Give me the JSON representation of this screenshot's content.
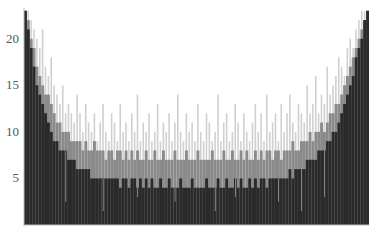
{
  "chart_data": {
    "type": "bar",
    "title": "",
    "xlabel": "",
    "ylabel": "",
    "ylim": [
      0,
      23.3
    ],
    "yticks": [
      5,
      10,
      15,
      20
    ],
    "grid": false,
    "legend": null,
    "n_bins": 120,
    "series": [
      {
        "name": "light",
        "color": "#c8c8c8",
        "values": [
          23,
          23,
          22,
          21,
          20,
          19,
          21,
          17,
          16,
          18,
          15,
          14,
          13,
          15,
          12,
          13,
          12,
          11,
          14,
          12,
          10,
          13,
          11,
          10,
          12,
          9,
          11,
          13,
          10,
          9,
          12,
          11,
          9,
          13,
          10,
          11,
          9,
          12,
          10,
          14,
          9,
          11,
          10,
          12,
          9,
          10,
          13,
          9,
          11,
          10,
          12,
          9,
          11,
          14,
          10,
          9,
          12,
          10,
          11,
          9,
          13,
          10,
          9,
          12,
          11,
          9,
          10,
          14,
          9,
          11,
          12,
          9,
          10,
          13,
          11,
          9,
          12,
          10,
          9,
          11,
          13,
          10,
          12,
          9,
          14,
          10,
          11,
          12,
          9,
          13,
          10,
          12,
          14,
          11,
          10,
          13,
          12,
          11,
          15,
          12,
          13,
          16,
          12,
          14,
          13,
          17,
          14,
          15,
          16,
          18,
          17,
          16,
          19,
          20,
          19,
          21,
          22,
          23,
          23,
          23
        ]
      },
      {
        "name": "mid",
        "color": "#8a8a8a",
        "values": [
          23,
          22,
          20,
          19,
          17,
          16,
          15,
          14,
          14,
          13,
          12,
          11,
          11,
          10,
          10,
          10,
          9,
          9,
          9,
          9,
          8,
          9,
          8,
          8,
          9,
          8,
          8,
          8,
          7,
          8,
          8,
          7,
          8,
          8,
          7,
          8,
          7,
          8,
          7,
          8,
          7,
          7,
          8,
          7,
          7,
          8,
          7,
          7,
          8,
          7,
          7,
          7,
          8,
          7,
          7,
          7,
          8,
          7,
          7,
          7,
          8,
          7,
          7,
          7,
          7,
          8,
          7,
          7,
          7,
          8,
          7,
          7,
          8,
          7,
          7,
          8,
          7,
          8,
          7,
          7,
          8,
          7,
          8,
          7,
          8,
          8,
          7,
          8,
          8,
          7,
          8,
          8,
          8,
          9,
          8,
          8,
          9,
          9,
          9,
          10,
          9,
          10,
          10,
          11,
          10,
          11,
          12,
          12,
          13,
          13,
          14,
          15,
          16,
          17,
          18,
          19,
          20,
          21,
          22,
          23
        ]
      },
      {
        "name": "dark",
        "color": "#2a2a2a",
        "values": [
          23,
          21,
          19,
          17,
          15,
          14,
          13,
          12,
          11,
          10,
          9,
          9,
          8,
          8,
          8,
          7,
          7,
          7,
          6,
          6,
          6,
          6,
          6,
          5,
          5,
          5,
          5,
          5,
          5,
          5,
          5,
          5,
          5,
          4,
          5,
          5,
          4,
          5,
          5,
          4,
          5,
          4,
          5,
          4,
          5,
          4,
          4,
          5,
          4,
          4,
          5,
          4,
          4,
          4,
          5,
          4,
          4,
          4,
          5,
          4,
          4,
          4,
          4,
          5,
          4,
          4,
          4,
          5,
          4,
          4,
          5,
          4,
          4,
          5,
          4,
          5,
          4,
          4,
          5,
          4,
          5,
          4,
          5,
          5,
          4,
          5,
          5,
          5,
          5,
          5,
          5,
          5,
          6,
          5,
          6,
          6,
          6,
          6,
          7,
          7,
          7,
          7,
          8,
          8,
          8,
          9,
          9,
          10,
          10,
          11,
          12,
          13,
          14,
          15,
          16,
          18,
          19,
          20,
          22,
          23
        ]
      }
    ],
    "dropouts": [
      14,
      27,
      39,
      52,
      66,
      73,
      88,
      96,
      104
    ],
    "axes": {
      "y_label_color": "#555555",
      "tick_labels": [
        "5",
        "10",
        "15",
        "20"
      ]
    }
  }
}
